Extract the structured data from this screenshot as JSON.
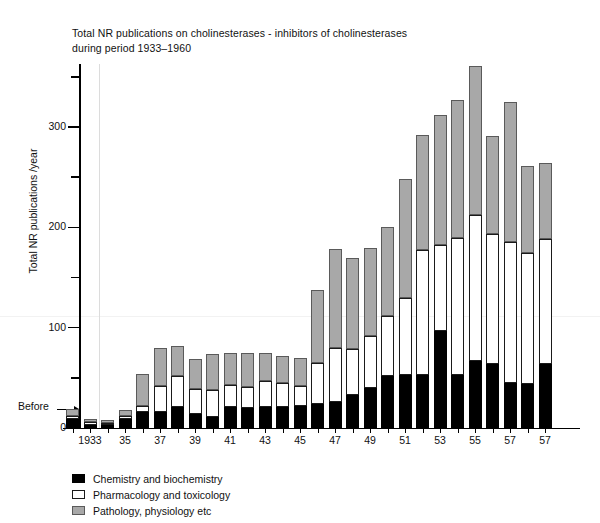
{
  "chart_data": {
    "type": "bar",
    "subtype": "stacked",
    "title": "Total NR publications on cholinesterases - inhibitors of cholinesterases during period 1933–1960",
    "title_lines": [
      "Total NR publications on cholinesterases - inhibitors of cholinesterases",
      "during period 1933–1960"
    ],
    "xlabel": "",
    "ylabel": "Total NR publications /year",
    "ylim": [
      0,
      366
    ],
    "yticks_major": [
      0,
      100,
      200,
      300
    ],
    "yticks_major_labels": [
      "0",
      "100",
      "200",
      "300"
    ],
    "yticks_minor": [
      50,
      150,
      250,
      350
    ],
    "grid": false,
    "legend_position": "below-left",
    "annotations": [
      {
        "name": "before-marker",
        "text": "Before",
        "target_category": "Before",
        "arrow": true
      }
    ],
    "categories": [
      "Before",
      "1933",
      "1934",
      "1935",
      "1936",
      "1937",
      "1938",
      "1939",
      "1940",
      "1941",
      "1942",
      "1943",
      "1944",
      "1945",
      "1946",
      "1947",
      "1948",
      "1949",
      "1950",
      "1951",
      "1952",
      "1953",
      "1954",
      "1955",
      "1956",
      "1957",
      "1958",
      "1959"
    ],
    "tick_labels": [
      "",
      "1933",
      "",
      "35",
      "",
      "37",
      "",
      "39",
      "",
      "41",
      "",
      "43",
      "",
      "45",
      "",
      "47",
      "",
      "49",
      "",
      "51",
      "",
      "53",
      "",
      "55",
      "",
      "57",
      "",
      "57"
    ],
    "series": [
      {
        "name": "Chemistry and biochemistry",
        "color": "#000000",
        "values": [
          9,
          3,
          3,
          9,
          16,
          16,
          21,
          14,
          11,
          21,
          20,
          21,
          21,
          22,
          24,
          26,
          33,
          40,
          52,
          53,
          53,
          97,
          53,
          67,
          64,
          45,
          44,
          64
        ]
      },
      {
        "name": "Pharmacology and toxicology",
        "color": "#ffffff",
        "values": [
          3,
          3,
          2,
          3,
          6,
          26,
          31,
          25,
          27,
          22,
          21,
          26,
          24,
          20,
          41,
          54,
          46,
          52,
          60,
          77,
          124,
          85,
          136,
          145,
          129,
          140,
          130,
          124
        ]
      },
      {
        "name": "Pathology, physiology etc",
        "color": "#a8a8a8",
        "values": [
          7,
          3,
          3,
          6,
          32,
          38,
          30,
          30,
          36,
          32,
          34,
          28,
          27,
          28,
          73,
          98,
          90,
          87,
          88,
          118,
          115,
          130,
          138,
          149,
          98,
          140,
          87,
          76
        ]
      }
    ]
  },
  "legend": {
    "items": [
      {
        "label": "Chemistry and biochemistry",
        "swatch": "chem"
      },
      {
        "label": "Pharmacology and toxicology",
        "swatch": "pharm"
      },
      {
        "label": "Pathology, physiology etc",
        "swatch": "path"
      }
    ]
  },
  "axes": {
    "y_title": "Total NR publications /year",
    "before_label": "Before"
  },
  "colors": {
    "chemistry": "#000000",
    "pharmacology": "#ffffff",
    "pathology": "#a8a8a8",
    "axis": "#000000",
    "text": "#111111"
  }
}
